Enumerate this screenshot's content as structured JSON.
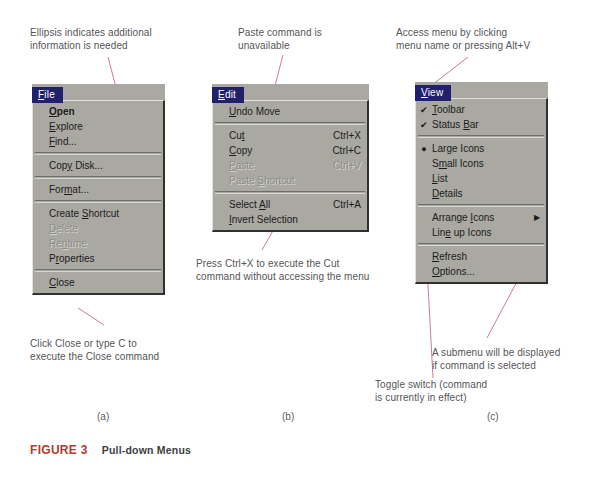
{
  "figure": {
    "number": "FIGURE 3",
    "title": "Pull-down Menus"
  },
  "part_labels": {
    "a": "(a)",
    "b": "(b)",
    "c": "(c)"
  },
  "annotations": {
    "ellipsis": "Ellipsis indicates additional\ninformation is needed",
    "close": "Click Close or type C to\nexecute the Close command",
    "paste": "Paste command is\nunavailable",
    "ctrlx": "Press Ctrl+X to execute the Cut\ncommand without accessing the menu",
    "access": "Access menu by clicking\nmenu name or pressing  Alt+V",
    "submenu": "A submenu will be displayed\nif command is selected",
    "toggle": "Toggle switch (command\nis currently in effect)"
  },
  "colors": {
    "menu_face": "#a9a9a2",
    "menu_title_bg": "#21216b",
    "menu_title_fg": "#ffffff",
    "disabled_text": "#8d8d87",
    "leader_line": "#c4707a",
    "figure_number": "#b03a33"
  },
  "menus": {
    "file": {
      "title": "File",
      "title_mnemonic": "F",
      "items": [
        {
          "label": "Open",
          "mnemonic": "O",
          "accel": "",
          "state": "default",
          "gutter": ""
        },
        {
          "label": "Explore",
          "mnemonic": "E",
          "accel": "",
          "state": "normal",
          "gutter": ""
        },
        {
          "label": "Find...",
          "mnemonic": "F",
          "accel": "",
          "state": "normal",
          "gutter": ""
        },
        {
          "separator": true
        },
        {
          "label": "Copy Disk...",
          "mnemonic": "y",
          "accel": "",
          "state": "normal",
          "gutter": ""
        },
        {
          "separator": true
        },
        {
          "label": "Format...",
          "mnemonic": "m",
          "accel": "",
          "state": "normal",
          "gutter": ""
        },
        {
          "separator": true
        },
        {
          "label": "Create Shortcut",
          "mnemonic": "S",
          "accel": "",
          "state": "normal",
          "gutter": ""
        },
        {
          "label": "Delete",
          "mnemonic": "D",
          "accel": "",
          "state": "disabled",
          "gutter": ""
        },
        {
          "label": "Rename",
          "mnemonic": "n",
          "accel": "",
          "state": "disabled",
          "gutter": ""
        },
        {
          "label": "Properties",
          "mnemonic": "r",
          "accel": "",
          "state": "normal",
          "gutter": ""
        },
        {
          "separator": true
        },
        {
          "label": "Close",
          "mnemonic": "C",
          "accel": "",
          "state": "normal",
          "gutter": ""
        }
      ]
    },
    "edit": {
      "title": "Edit",
      "title_mnemonic": "E",
      "items": [
        {
          "label": "Undo Move",
          "mnemonic": "U",
          "accel": "",
          "state": "normal",
          "gutter": ""
        },
        {
          "separator": true
        },
        {
          "label": "Cut",
          "mnemonic": "t",
          "accel": "Ctrl+X",
          "state": "normal",
          "gutter": ""
        },
        {
          "label": "Copy",
          "mnemonic": "C",
          "accel": "Ctrl+C",
          "state": "normal",
          "gutter": ""
        },
        {
          "label": "Paste",
          "mnemonic": "P",
          "accel": "Ctrl+V",
          "state": "disabled",
          "gutter": ""
        },
        {
          "label": "Paste Shortcut",
          "mnemonic": "S",
          "accel": "",
          "state": "disabled",
          "gutter": ""
        },
        {
          "separator": true
        },
        {
          "label": "Select All",
          "mnemonic": "A",
          "accel": "Ctrl+A",
          "state": "normal",
          "gutter": ""
        },
        {
          "label": "Invert Selection",
          "mnemonic": "I",
          "accel": "",
          "state": "normal",
          "gutter": ""
        }
      ]
    },
    "view": {
      "title": "View",
      "title_mnemonic": "V",
      "items": [
        {
          "label": "Toolbar",
          "mnemonic": "T",
          "accel": "",
          "state": "normal",
          "gutter": "check"
        },
        {
          "label": "Status Bar",
          "mnemonic": "B",
          "accel": "",
          "state": "normal",
          "gutter": "check"
        },
        {
          "separator": true
        },
        {
          "label": "Large Icons",
          "mnemonic": "",
          "accel": "",
          "state": "normal",
          "gutter": "radio"
        },
        {
          "label": "Small Icons",
          "mnemonic": "m",
          "accel": "",
          "state": "normal",
          "gutter": ""
        },
        {
          "label": "List",
          "mnemonic": "L",
          "accel": "",
          "state": "normal",
          "gutter": ""
        },
        {
          "label": "Details",
          "mnemonic": "D",
          "accel": "",
          "state": "normal",
          "gutter": ""
        },
        {
          "separator": true
        },
        {
          "label": "Arrange Icons",
          "mnemonic": "I",
          "accel": "",
          "state": "normal",
          "gutter": "",
          "submenu": true
        },
        {
          "label": "Line up Icons",
          "mnemonic": "e",
          "accel": "",
          "state": "normal",
          "gutter": ""
        },
        {
          "separator": true
        },
        {
          "label": "Refresh",
          "mnemonic": "R",
          "accel": "",
          "state": "normal",
          "gutter": ""
        },
        {
          "label": "Options...",
          "mnemonic": "O",
          "accel": "",
          "state": "normal",
          "gutter": ""
        }
      ]
    }
  }
}
